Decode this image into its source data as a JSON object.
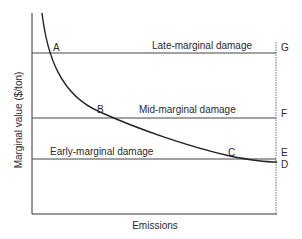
{
  "diagram": {
    "type": "marginal-value-vs-emissions",
    "axes": {
      "y_label": "Marginal value ($/ton)",
      "x_label": "Emissions"
    },
    "lines": [
      {
        "id": "late",
        "label": "Late-marginal damage",
        "end_label": "G"
      },
      {
        "id": "mid",
        "label": "Mid-marginal damage",
        "end_label": "F"
      },
      {
        "id": "early",
        "label": "Early-marginal damage",
        "end_label": "E"
      }
    ],
    "curve_end_label": "D",
    "intersections": [
      {
        "label": "A",
        "line": "late"
      },
      {
        "label": "B",
        "line": "mid"
      },
      {
        "label": "C",
        "line": "early"
      }
    ],
    "colors": {
      "line": "#444444",
      "curve": "#222222",
      "text": "#2a2a2a",
      "dashed": "#777777"
    }
  }
}
